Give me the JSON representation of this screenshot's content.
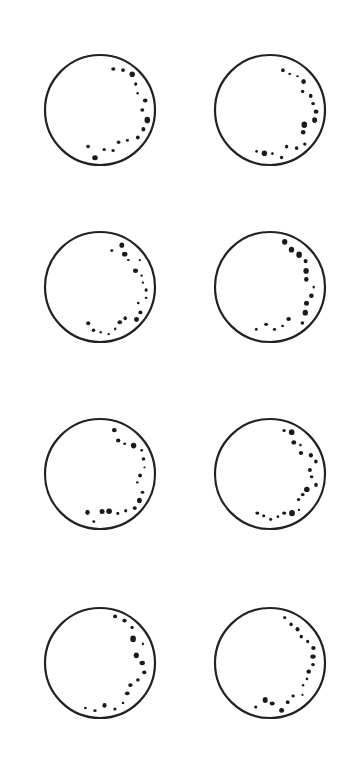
{
  "figure": {
    "background": "#ffffff",
    "stroke_color": "#222222",
    "dot_color": "#1a1a1a",
    "radius": 55,
    "stroke_width": 2.2,
    "discs": [
      {
        "id": "disc-1",
        "cx": 100,
        "cy": 110
      },
      {
        "id": "disc-2",
        "cx": 270,
        "cy": 110
      },
      {
        "id": "disc-3",
        "cx": 100,
        "cy": 287
      },
      {
        "id": "disc-4",
        "cx": 270,
        "cy": 287
      },
      {
        "id": "disc-5",
        "cx": 100,
        "cy": 474
      },
      {
        "id": "disc-6",
        "cx": 270,
        "cy": 474
      },
      {
        "id": "disc-7",
        "cx": 100,
        "cy": 663
      },
      {
        "id": "disc-8",
        "cx": 270,
        "cy": 663
      }
    ]
  }
}
